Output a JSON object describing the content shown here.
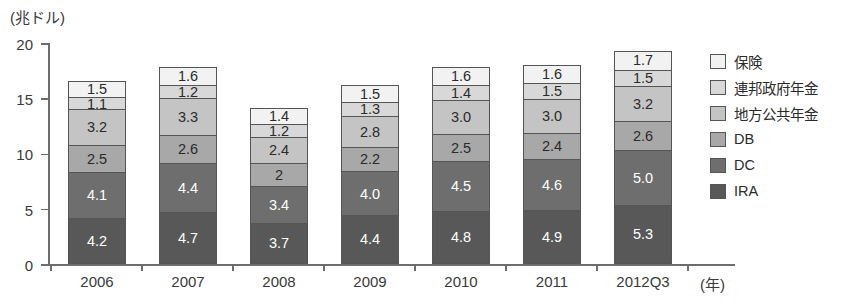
{
  "chart_data": {
    "type": "bar",
    "stacked": true,
    "title": "",
    "xlabel": "(年)",
    "ylabel": "(兆ドル)",
    "ylim": [
      0,
      20
    ],
    "yticks": [
      0,
      5,
      10,
      15,
      20
    ],
    "grid": false,
    "legend_position": "right",
    "categories": [
      "2006",
      "2007",
      "2008",
      "2009",
      "2010",
      "2011",
      "2012Q3"
    ],
    "series": [
      {
        "name": "IRA",
        "color": "#585858",
        "label_color": "#ffffff",
        "values": [
          4.2,
          4.7,
          3.7,
          4.4,
          4.8,
          4.9,
          5.3
        ],
        "labels": [
          "4.2",
          "4.7",
          "3.7",
          "4.4",
          "4.8",
          "4.9",
          "5.3"
        ]
      },
      {
        "name": "DC",
        "color": "#6e6e6e",
        "label_color": "#ffffff",
        "values": [
          4.1,
          4.4,
          3.4,
          4.0,
          4.5,
          4.6,
          5.0
        ],
        "labels": [
          "4.1",
          "4.4",
          "3.4",
          "4.0",
          "4.5",
          "4.6",
          "5.0"
        ]
      },
      {
        "name": "DB",
        "color": "#a8a8a8",
        "label_color": "#2b2b2b",
        "values": [
          2.5,
          2.6,
          2.0,
          2.2,
          2.5,
          2.4,
          2.6
        ],
        "labels": [
          "2.5",
          "2.6",
          "2",
          "2.2",
          "2.5",
          "2.4",
          "2.6"
        ]
      },
      {
        "name": "地方公共年金",
        "color": "#c4c4c4",
        "label_color": "#2b2b2b",
        "values": [
          3.2,
          3.3,
          2.4,
          2.8,
          3.0,
          3.0,
          3.2
        ],
        "labels": [
          "3.2",
          "3.3",
          "2.4",
          "2.8",
          "3.0",
          "3.0",
          "3.2"
        ]
      },
      {
        "name": "連邦政府年金",
        "color": "#d8d8d8",
        "label_color": "#2b2b2b",
        "values": [
          1.1,
          1.2,
          1.2,
          1.3,
          1.4,
          1.5,
          1.5
        ],
        "labels": [
          "1.1",
          "1.2",
          "1.2",
          "1.3",
          "1.4",
          "1.5",
          "1.5"
        ]
      },
      {
        "name": "保険",
        "color": "#f2f2f2",
        "label_color": "#2b2b2b",
        "values": [
          1.5,
          1.6,
          1.4,
          1.5,
          1.6,
          1.6,
          1.7
        ],
        "labels": [
          "1.5",
          "1.6",
          "1.4",
          "1.5",
          "1.6",
          "1.6",
          "1.7"
        ]
      }
    ],
    "totals": [
      16.6,
      17.8,
      14.1,
      16.2,
      17.8,
      18.0,
      19.3
    ]
  },
  "axes": {
    "y_unit": "(兆ドル)",
    "x_unit": "(年)",
    "y_tick_labels": [
      "0",
      "5",
      "10",
      "15",
      "20"
    ]
  },
  "legend": {
    "items": [
      {
        "label": "保険",
        "color": "#f2f2f2"
      },
      {
        "label": "連邦政府年金",
        "color": "#d8d8d8"
      },
      {
        "label": "地方公共年金",
        "color": "#c4c4c4"
      },
      {
        "label": "DB",
        "color": "#a8a8a8"
      },
      {
        "label": "DC",
        "color": "#6e6e6e"
      },
      {
        "label": "IRA",
        "color": "#585858"
      }
    ]
  }
}
